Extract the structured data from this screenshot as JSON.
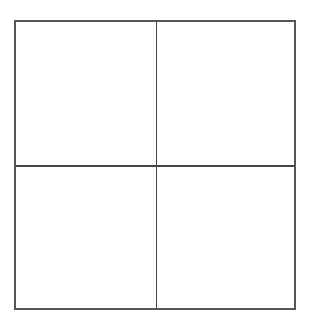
{
  "diagram": {
    "type": "grid",
    "rows": 2,
    "columns": 2,
    "cells": [
      {
        "row": 0,
        "col": 0,
        "label": ""
      },
      {
        "row": 0,
        "col": 1,
        "label": ""
      },
      {
        "row": 1,
        "col": 0,
        "label": ""
      },
      {
        "row": 1,
        "col": 1,
        "label": ""
      }
    ],
    "line_color": "#555555",
    "background": "#ffffff"
  }
}
